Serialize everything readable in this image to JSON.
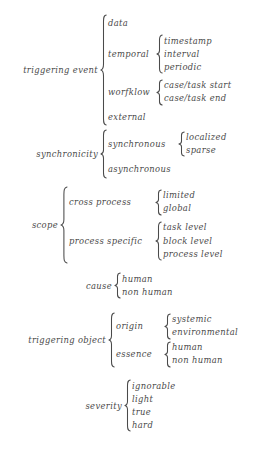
{
  "figure": {
    "type": "taxonomy-brace-diagram",
    "text_color": "#4a4a4a",
    "background_color": "#ffffff",
    "groups": [
      {
        "label": "triggering event",
        "children": [
          {
            "label": "data",
            "leaves": []
          },
          {
            "label": "temporal",
            "leaves": [
              "timestamp",
              "interval",
              "periodic"
            ]
          },
          {
            "label": "worfklow",
            "leaves": [
              "case/task start",
              "case/task end"
            ]
          },
          {
            "label": "external",
            "leaves": []
          }
        ]
      },
      {
        "label": "synchronicity",
        "children": [
          {
            "label": "synchronous",
            "leaves": [
              "localized",
              "sparse"
            ]
          },
          {
            "label": "asynchronous",
            "leaves": []
          }
        ]
      },
      {
        "label": "scope",
        "children": [
          {
            "label": "cross process",
            "leaves": [
              "limited",
              "global"
            ]
          },
          {
            "label": "process specific",
            "leaves": [
              "task level",
              "block level",
              "process level"
            ]
          }
        ]
      },
      {
        "label": "cause",
        "children": [
          {
            "label": "human",
            "leaves": []
          },
          {
            "label": "non human",
            "leaves": []
          }
        ]
      },
      {
        "label": "triggering object",
        "children": [
          {
            "label": "origin",
            "leaves": [
              "systemic",
              "environmental"
            ]
          },
          {
            "label": "essence",
            "leaves": [
              "human",
              "non human"
            ]
          }
        ]
      },
      {
        "label": "severity",
        "children": [
          {
            "label": "ignorable",
            "leaves": []
          },
          {
            "label": "light",
            "leaves": []
          },
          {
            "label": "true",
            "leaves": []
          },
          {
            "label": "hard",
            "leaves": []
          }
        ]
      }
    ]
  }
}
